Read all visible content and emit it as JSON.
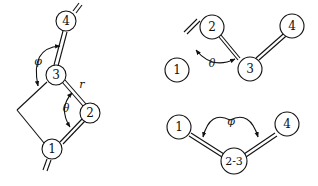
{
  "figure": {
    "left_panel": {
      "atoms": [
        "4",
        "3",
        "2",
        "1"
      ],
      "labels": {
        "phi": "φ",
        "theta": "θ",
        "r": "r"
      }
    },
    "top_right_panel": {
      "atoms": [
        "1",
        "2",
        "3",
        "4"
      ],
      "labels": {
        "theta": "θ"
      }
    },
    "bottom_right_panel": {
      "atoms": [
        "1",
        "2-3",
        "4"
      ],
      "labels": {
        "phi": "φ"
      }
    }
  }
}
